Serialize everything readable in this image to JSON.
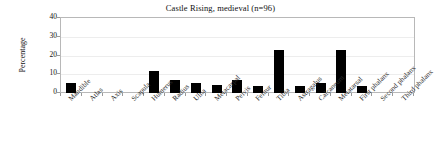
{
  "chart_data": {
    "type": "bar",
    "title": "Castle Rising, medieval (n=96)",
    "xlabel": "",
    "ylabel": "Percentage",
    "ylim": [
      0,
      40
    ],
    "yticks": [
      0,
      10,
      20,
      30,
      40
    ],
    "grid": true,
    "legend": false,
    "bar_color": "#000000",
    "categories": [
      "Mandible",
      "Atlas",
      "Axis",
      "Scapula",
      "Humerus",
      "Radius",
      "Ulna",
      "Metacarpal",
      "Pelvis",
      "Femur",
      "Tibia",
      "Astragalus",
      "Calcaneum",
      "Metatarsal",
      "First phalanx",
      "Second phalanx",
      "Third phalanx"
    ],
    "values": [
      5.3,
      0,
      0,
      0,
      12,
      7,
      5.5,
      4.5,
      7,
      3.5,
      23,
      3.5,
      5.5,
      23,
      3.5,
      0,
      0
    ]
  }
}
